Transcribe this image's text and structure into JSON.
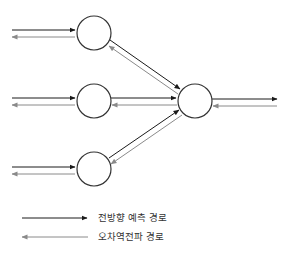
{
  "diagram": {
    "type": "neural-network-signal-flow",
    "colors": {
      "forward": "#1a1a1a",
      "backward": "#8a8a8a",
      "node_stroke": "#333333",
      "node_fill": "#ffffff"
    },
    "nodes": [
      {
        "id": "hidden-1",
        "cx": 94,
        "cy": 33,
        "r": 17
      },
      {
        "id": "hidden-2",
        "cx": 94,
        "cy": 101,
        "r": 17
      },
      {
        "id": "hidden-3",
        "cx": 94,
        "cy": 169,
        "r": 17
      },
      {
        "id": "output",
        "cx": 195,
        "cy": 101,
        "r": 17
      }
    ],
    "edges": [
      {
        "from": "input-1",
        "to": "hidden-1",
        "bidirectional": true
      },
      {
        "from": "input-2",
        "to": "hidden-2",
        "bidirectional": true
      },
      {
        "from": "input-3",
        "to": "hidden-3",
        "bidirectional": true
      },
      {
        "from": "hidden-1",
        "to": "output",
        "bidirectional": true
      },
      {
        "from": "hidden-2",
        "to": "output",
        "bidirectional": true
      },
      {
        "from": "hidden-3",
        "to": "output",
        "bidirectional": true
      },
      {
        "from": "output",
        "to": "result",
        "bidirectional": true
      }
    ]
  },
  "legend": {
    "forward_label": "전방향 예측 경로",
    "backward_label": "오차역전파 경로"
  }
}
